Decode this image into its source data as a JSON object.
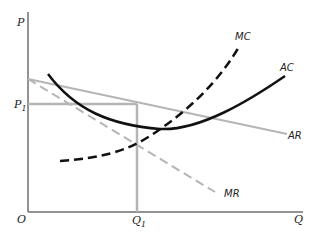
{
  "diagram": {
    "type": "economics-cost-revenue",
    "axes": {
      "y_label": "P",
      "x_label": "Q",
      "origin_label": "O"
    },
    "markers": {
      "price_label": "P",
      "price_sub": "1",
      "quantity_label": "Q",
      "quantity_sub": "1"
    },
    "curves": [
      {
        "name": "MC",
        "label": "MC",
        "style": "dashed",
        "color": "#111111"
      },
      {
        "name": "AC",
        "label": "AC",
        "style": "solid",
        "color": "#111111"
      },
      {
        "name": "AR",
        "label": "AR",
        "style": "solid",
        "color": "#b5b5b5"
      },
      {
        "name": "MR",
        "label": "MR",
        "style": "dashed",
        "color": "#b5b5b5"
      }
    ],
    "colors": {
      "axis": "#6f6f6f",
      "guide": "#b5b5b5",
      "cost": "#111111"
    }
  }
}
